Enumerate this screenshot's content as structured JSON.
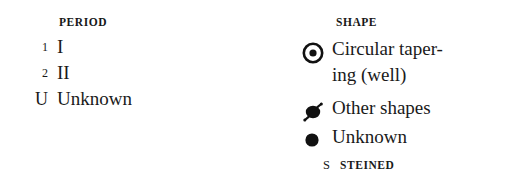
{
  "legend": {
    "background_color": "#ffffff",
    "ink_color": "#1a1a1a",
    "columns": [
      {
        "id": "period",
        "header": "PERIOD",
        "entries": [
          {
            "marker": "1",
            "label": "I"
          },
          {
            "marker": "2",
            "label": "II"
          },
          {
            "marker": "U",
            "label": "Unknown"
          }
        ]
      },
      {
        "id": "shape",
        "header": "SHAPE",
        "entries": [
          {
            "symbol": "bullseye-icon",
            "label": "Circular taper-\ning (well)"
          },
          {
            "symbol": "spiked-dot-icon",
            "label": "Other shapes"
          },
          {
            "symbol": "filled-dot-icon",
            "label": "Unknown"
          }
        ],
        "footer": {
          "marker": "S",
          "label": "STEINED"
        }
      }
    ]
  }
}
